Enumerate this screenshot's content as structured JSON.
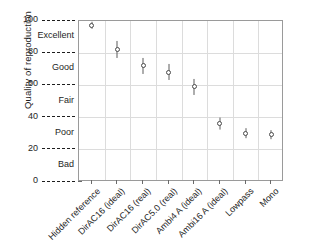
{
  "chart_data": {
    "type": "scatter",
    "title": "",
    "xlabel": "",
    "ylabel": "Quality of reproduction",
    "ylim": [
      0,
      100
    ],
    "grid": true,
    "legend": "none",
    "y_tick_values": [
      0,
      20,
      40,
      60,
      80,
      100
    ],
    "y_tick_labels": [
      "0",
      "20",
      "40",
      "60",
      "80",
      "100"
    ],
    "y_category_labels": [
      "Bad",
      "Poor",
      "Fair",
      "Good",
      "Excellent"
    ],
    "y_category_centers": [
      10,
      30,
      50,
      70,
      90
    ],
    "categories": [
      "Hidden reference",
      "DirAC16 (ideal)",
      "DirAC16 (real)",
      "DirAC5.0 (real)",
      "Ambi4 A (ideal)",
      "Ambi16 A (ideal)",
      "Lowpass",
      "Mono"
    ],
    "values": [
      97,
      82,
      72,
      68,
      59,
      36,
      30,
      29
    ],
    "ci_low": [
      95,
      77,
      67,
      63,
      54,
      32,
      27,
      26
    ],
    "ci_high": [
      99,
      87,
      77,
      73,
      64,
      40,
      33,
      32
    ],
    "marker": "open-circle",
    "marker_color": "#4a4a4a",
    "error_bar_color": "#5c5c5c",
    "grid_color": "#dcdcdc",
    "axis_color": "#9a9a9a"
  }
}
